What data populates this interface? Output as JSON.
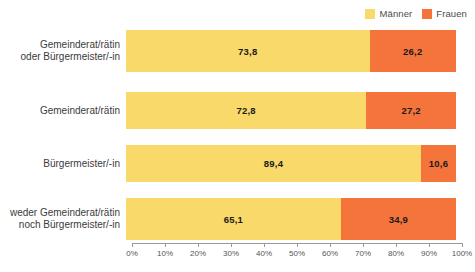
{
  "legend": {
    "items": [
      {
        "label": "Männer",
        "color": "#f8d96a",
        "icon": "square-swatch-icon"
      },
      {
        "label": "Frauen",
        "color": "#f4743c",
        "icon": "square-swatch-icon"
      }
    ]
  },
  "axis": {
    "ticks": [
      "0%",
      "10%",
      "20%",
      "30%",
      "40%",
      "50%",
      "60%",
      "70%",
      "80%",
      "90%",
      "100%"
    ]
  },
  "rows": [
    {
      "label": "Gemeinderat/rätin\noder Bürgermeister/-in",
      "maenner": "73,8",
      "frauen": "26,2"
    },
    {
      "label": "Gemeinderat/rätin",
      "maenner": "72,8",
      "frauen": "27,2"
    },
    {
      "label": "Bürgermeister/-in",
      "maenner": "89,4",
      "frauen": "10,6"
    },
    {
      "label": "weder Gemeinderat/rätin\nnoch Bürgermeister/-in",
      "maenner": "65,1",
      "frauen": "34,9"
    }
  ],
  "chart_data": {
    "type": "bar",
    "orientation": "horizontal",
    "stacked": true,
    "normalized": true,
    "title": "",
    "xlabel": "",
    "ylabel": "",
    "xlim": [
      0,
      100
    ],
    "xticks": [
      0,
      10,
      20,
      30,
      40,
      50,
      60,
      70,
      80,
      90,
      100
    ],
    "xtick_labels": [
      "0%",
      "10%",
      "20%",
      "30%",
      "40%",
      "50%",
      "60%",
      "70%",
      "80%",
      "90%",
      "100%"
    ],
    "grid": false,
    "legend_position": "top-right",
    "categories": [
      "Gemeinderat/rätin oder Bürgermeister/-in",
      "Gemeinderat/rätin",
      "Bürgermeister/-in",
      "weder Gemeinderat/rätin noch Bürgermeister/-in"
    ],
    "series": [
      {
        "name": "Männer",
        "color": "#f8d96a",
        "values": [
          73.8,
          72.8,
          89.4,
          65.1
        ]
      },
      {
        "name": "Frauen",
        "color": "#f4743c",
        "values": [
          26.2,
          27.2,
          10.6,
          34.9
        ]
      }
    ]
  }
}
